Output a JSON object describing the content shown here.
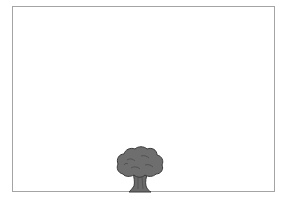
{
  "stage": {
    "background": "#ffffff",
    "border_color": "#a4a4a4"
  },
  "sprites": [
    {
      "name": "tree",
      "icon": "tree-icon",
      "canopy_color": "#6e6e6e",
      "trunk_color": "#6a6a6a",
      "outline_color": "#3a3a3a"
    }
  ]
}
